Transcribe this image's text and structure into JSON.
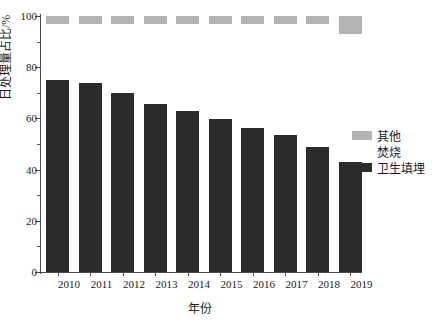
{
  "chart_data": {
    "type": "bar",
    "subtype": "stacked-bar-100",
    "title": "",
    "xlabel": "年份",
    "ylabel": "日处理量占比/%",
    "ylim": [
      0,
      100
    ],
    "ytick_values": [
      0,
      20,
      40,
      60,
      80,
      100
    ],
    "ytick_labels": [
      "0",
      "20",
      "40",
      "60",
      "80",
      "100"
    ],
    "yminor_values": [
      10,
      30,
      50,
      70,
      90
    ],
    "grid": false,
    "legend_position": "right",
    "categories": [
      "2010",
      "2011",
      "2012",
      "2013",
      "2014",
      "2015",
      "2016",
      "2017",
      "2018",
      "2019"
    ],
    "series": [
      {
        "name": "卫生填埋",
        "color": "#2b2b2b",
        "values": [
          75.0,
          73.8,
          69.9,
          65.6,
          62.9,
          59.6,
          56.3,
          53.5,
          49.0,
          43.0
        ]
      },
      {
        "name": "焚烧",
        "color": "#ffffff",
        "values": [
          22.0,
          23.2,
          27.1,
          31.4,
          34.1,
          37.4,
          40.7,
          43.5,
          48.0,
          50.0
        ]
      },
      {
        "name": "其他",
        "color": "#b3b3b3",
        "values": [
          3.0,
          3.0,
          3.0,
          3.0,
          3.0,
          3.0,
          3.0,
          3.0,
          3.0,
          7.0
        ]
      }
    ]
  },
  "legend": {
    "items": [
      {
        "label": "其他",
        "color": "#b3b3b3"
      },
      {
        "label": "焚烧",
        "color": "#ffffff"
      },
      {
        "label": "卫生填埋",
        "color": "#2b2b2b"
      }
    ]
  },
  "axes": {
    "x_title": "年份",
    "y_title": "日处理量占比/%"
  },
  "colors": {
    "landfill": "#2b2b2b",
    "incineration": "#ffffff",
    "other": "#b3b3b3",
    "axis": "#4d4d4d",
    "text": "#1a1a1a",
    "background": "#ffffff"
  }
}
